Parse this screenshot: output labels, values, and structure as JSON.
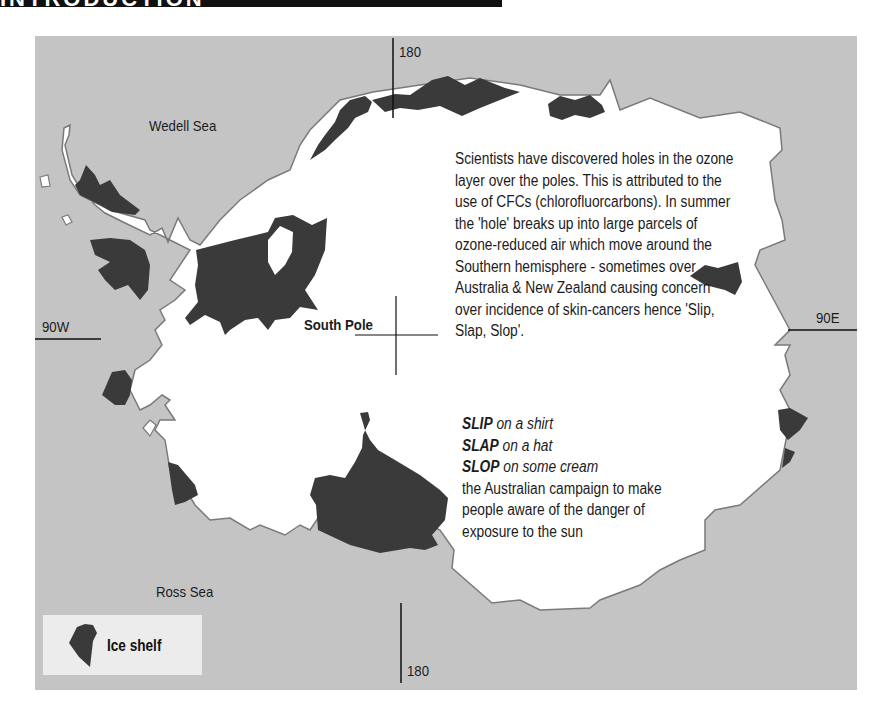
{
  "page": {
    "header_fragment": "INTRODUCTION"
  },
  "map": {
    "sea_color": "#c4c4c4",
    "land_color": "#ffffff",
    "ice_shelf_color": "#3a3a3a",
    "labels": {
      "wedell_sea": "Wedell Sea",
      "ross_sea": "Ross Sea",
      "south_pole": "South Pole",
      "lon_180_top": "180",
      "lon_180_bottom": "180",
      "lon_90w": "90W",
      "lon_90e": "90E"
    }
  },
  "annotation": {
    "paragraph": "Scientists have discovered holes in the ozone layer over the poles. This is attributed to the use of CFCs (chlorofluorcarbons). In summer the 'hole' breaks up into large parcels of ozone-reduced air which move around the Southern hemisphere - sometimes over Australia & New Zealand causing concern over incidence of skin-cancers hence 'Slip, Slap, Slop'.",
    "slogans": [
      {
        "word": "SLIP",
        "rest": "on a shirt"
      },
      {
        "word": "SLAP",
        "rest": "on a hat"
      },
      {
        "word": "SLOP",
        "rest": "on some cream"
      }
    ],
    "campaign_note": "the Australian campaign to make people aware of the danger of exposure to the sun"
  },
  "legend": {
    "items": [
      {
        "label": "Ice shelf",
        "color": "#3a3a3a"
      }
    ]
  }
}
